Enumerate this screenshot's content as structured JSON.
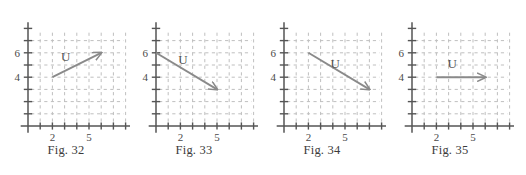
{
  "page": {
    "background_color": "#ffffff",
    "axis_color": "#555555",
    "grid_color": "#bfbfbf",
    "vector_color": "#8a8a8a",
    "text_color": "#3b3b3b"
  },
  "figures": [
    {
      "caption": "Fig. 32",
      "vector_label": "U",
      "x_tick_labels": [
        "2",
        "5"
      ],
      "y_tick_labels": [
        "6",
        "4"
      ],
      "vector": {
        "x1": 2,
        "y1": 4,
        "x2": 6,
        "y2": 6
      },
      "label_pos": {
        "x": 3.1,
        "y": 5.35
      }
    },
    {
      "caption": "Fig. 33",
      "vector_label": "U",
      "x_tick_labels": [
        "2",
        "5"
      ],
      "y_tick_labels": [
        "6",
        "4"
      ],
      "vector": {
        "x1": 0,
        "y1": 6,
        "x2": 5,
        "y2": 3
      },
      "label_pos": {
        "x": 2.2,
        "y": 5.1
      }
    },
    {
      "caption": "Fig. 34",
      "vector_label": "U",
      "x_tick_labels": [
        "2",
        "5"
      ],
      "y_tick_labels": [
        "6",
        "4"
      ],
      "vector": {
        "x1": 2,
        "y1": 6,
        "x2": 7,
        "y2": 3
      },
      "label_pos": {
        "x": 4.2,
        "y": 4.75
      }
    },
    {
      "caption": "Fig. 35",
      "vector_label": "U",
      "x_tick_labels": [
        "2",
        "5"
      ],
      "y_tick_labels": [
        "6",
        "4"
      ],
      "vector": {
        "x1": 2,
        "y1": 4,
        "x2": 6,
        "y2": 4
      },
      "label_pos": {
        "x": 3.3,
        "y": 4.75
      }
    }
  ],
  "chart_data": {
    "type": "scatter",
    "title": "",
    "xlabel": "",
    "ylabel": "",
    "xlim": [
      0,
      8
    ],
    "ylim": [
      0,
      8
    ],
    "grid": true,
    "legend": "none",
    "x_ticks": [
      1,
      2,
      3,
      4,
      5,
      6,
      7
    ],
    "y_ticks": [
      1,
      2,
      3,
      4,
      5,
      6,
      7
    ],
    "x_tick_labels_shown": {
      "2": "2",
      "5": "5"
    },
    "y_tick_labels_shown": {
      "4": "4",
      "6": "6"
    },
    "panels": [
      {
        "name": "Fig. 32",
        "vectors": [
          {
            "label": "U",
            "tail": [
              2,
              4
            ],
            "head": [
              6,
              6
            ],
            "components": [
              4,
              2
            ]
          }
        ]
      },
      {
        "name": "Fig. 33",
        "vectors": [
          {
            "label": "U",
            "tail": [
              0,
              6
            ],
            "head": [
              5,
              3
            ],
            "components": [
              5,
              -3
            ]
          }
        ]
      },
      {
        "name": "Fig. 34",
        "vectors": [
          {
            "label": "U",
            "tail": [
              2,
              6
            ],
            "head": [
              7,
              3
            ],
            "components": [
              5,
              -3
            ]
          }
        ]
      },
      {
        "name": "Fig. 35",
        "vectors": [
          {
            "label": "U",
            "tail": [
              2,
              4
            ],
            "head": [
              6,
              4
            ],
            "components": [
              4,
              0
            ]
          }
        ]
      }
    ]
  }
}
